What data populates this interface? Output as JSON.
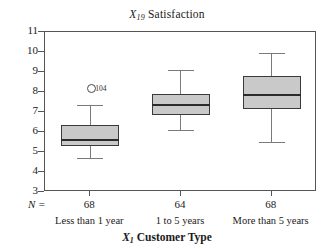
{
  "chart_data": {
    "type": "boxplot",
    "title": "X19 Satisfaction",
    "title_var": "X",
    "title_sub": "19",
    "title_word": "Satisfaction",
    "xlabel": "X1 Customer Type",
    "xlabel_var": "X",
    "xlabel_sub": "1",
    "xlabel_word": "Customer Type",
    "ylabel": "",
    "ylim": [
      3,
      11
    ],
    "yticks": [
      11,
      10,
      9,
      8,
      7,
      6,
      5,
      4,
      3
    ],
    "grid": false,
    "legend": "none",
    "n_prefix": "N =",
    "categories": [
      "Less than 1 year",
      "1 to 5 years",
      "More than 5 years"
    ],
    "counts": [
      68,
      64,
      68
    ],
    "boxes": [
      {
        "category": "Less than 1 year",
        "n": 68,
        "whisker_low": 4.7,
        "q1": 5.3,
        "median": 5.65,
        "q3": 6.35,
        "whisker_high": 7.35,
        "outliers": [
          {
            "value": 8.25,
            "label": "104"
          }
        ]
      },
      {
        "category": "1 to 5 years",
        "n": 64,
        "whisker_low": 6.1,
        "q1": 6.85,
        "median": 7.4,
        "q3": 7.9,
        "whisker_high": 9.1,
        "outliers": []
      },
      {
        "category": "More than 5 years",
        "n": 68,
        "whisker_low": 5.5,
        "q1": 7.15,
        "median": 7.9,
        "q3": 8.8,
        "whisker_high": 9.95,
        "outliers": []
      }
    ],
    "colors": {
      "box_fill": "#c9c9c9",
      "box_border": "#3a3a3a",
      "median": "#2b2b2b",
      "whisker": "#7a7a7a",
      "axis": "#555555",
      "background": "#ffffff"
    }
  }
}
